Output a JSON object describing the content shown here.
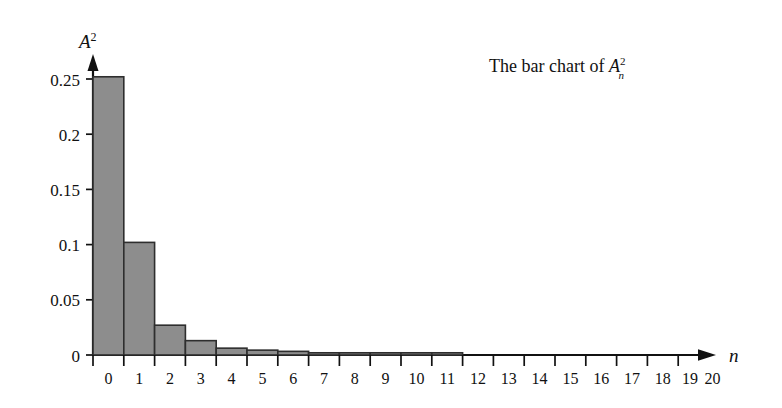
{
  "chart_data": {
    "type": "bar",
    "title": "The bar chart of A",
    "title_var": "A",
    "title_sup": "2",
    "title_sub": "n",
    "title_plain": "The bar chart of A_n^2",
    "xlabel": "n",
    "ylabel": "A",
    "ylabel_sup": "2",
    "ylabel_plain": "A^2",
    "categories": [
      0,
      1,
      2,
      3,
      4,
      5,
      6,
      7,
      8,
      9,
      10,
      11,
      12,
      13,
      14,
      15,
      16,
      17,
      18,
      19,
      20
    ],
    "values": [
      0.252,
      0.102,
      0.027,
      0.013,
      0.0062,
      0.0044,
      0.0033,
      0.002,
      0.002,
      0.002,
      0.002,
      0.002,
      0,
      0,
      0,
      0,
      0,
      0,
      0,
      0,
      0
    ],
    "xtick_labels": [
      "0",
      "1",
      "2",
      "3",
      "4",
      "5",
      "6",
      "7",
      "8",
      "9",
      "10",
      "11",
      "12",
      "13",
      "14",
      "15",
      "16",
      "17",
      "18",
      "19",
      "20"
    ],
    "ytick_labels": [
      "0",
      "0.05",
      "0.1",
      "0.15",
      "0.2",
      "0.25"
    ],
    "ytick_values": [
      0,
      0.05,
      0.1,
      0.15,
      0.2,
      0.25
    ],
    "ylim": [
      0,
      0.262
    ],
    "xlim": [
      0,
      21
    ],
    "grid": false,
    "legend": false,
    "bar_color": "#8d8d8d",
    "bar_edge_color": "#2e2e2e",
    "axis_color": "#111111",
    "background": "#ffffff"
  },
  "ytick_labels": {
    "t0": "0",
    "t1": "0.05",
    "t2": "0.1",
    "t3": "0.15",
    "t4": "0.2",
    "t5": "0.25"
  },
  "xtick_labels": {
    "t0": "0",
    "t1": "1",
    "t2": "2",
    "t3": "3",
    "t4": "4",
    "t5": "5",
    "t6": "6",
    "t7": "7",
    "t8": "8",
    "t9": "9",
    "t10": "10",
    "t11": "11",
    "t12": "12",
    "t13": "13",
    "t14": "14",
    "t15": "15",
    "t16": "16",
    "t17": "17",
    "t18": "18",
    "t19": "19",
    "t20": "20"
  },
  "labels": {
    "title_prefix": "The bar chart of ",
    "title_var": "A",
    "title_sup": "2",
    "title_sub": "n",
    "yaxis_var": "A",
    "yaxis_sup": "2",
    "xaxis_var": "n"
  }
}
